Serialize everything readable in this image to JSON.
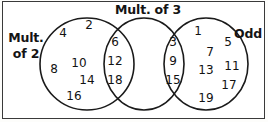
{
  "diagram": {
    "type": "venn",
    "set_count": 3,
    "stroke_color": "#1a1a1a",
    "fill_color": "#ffffff",
    "frame_color": "#3a3a3a",
    "sets": [
      {
        "id": "mult2",
        "label_line1": "Mult.",
        "label_line2": "of 2",
        "label_full": "Mult. of 2",
        "position": "left"
      },
      {
        "id": "mult3",
        "label_line1": "Mult. of 3",
        "label_line2": "",
        "label_full": "Mult. of 3",
        "position": "top-center"
      },
      {
        "id": "odd",
        "label_line1": "Odd",
        "label_line2": "",
        "label_full": "Odd",
        "position": "right"
      }
    ],
    "regions": {
      "mult2_only": {
        "name": "Mult. of 2 only",
        "values": [
          2,
          4,
          8,
          10,
          14,
          16
        ]
      },
      "mult2_and_mult3": {
        "name": "Mult. of 2 and Mult. of 3",
        "values": [
          6,
          12,
          18
        ]
      },
      "mult3_only": {
        "name": "Mult. of 3 only",
        "values": []
      },
      "mult3_and_odd": {
        "name": "Mult. of 3 and Odd",
        "values": [
          3,
          9,
          15
        ]
      },
      "odd_only": {
        "name": "Odd only",
        "values": [
          1,
          5,
          7,
          11,
          13,
          17,
          19
        ]
      }
    },
    "placed_numbers": [
      {
        "value": "4",
        "x": 63,
        "y": 33,
        "region": "mult2_only"
      },
      {
        "value": "2",
        "x": 89,
        "y": 25,
        "region": "mult2_only"
      },
      {
        "value": "8",
        "x": 54,
        "y": 69,
        "region": "mult2_only"
      },
      {
        "value": "10",
        "x": 79,
        "y": 63,
        "region": "mult2_only"
      },
      {
        "value": "14",
        "x": 87,
        "y": 80,
        "region": "mult2_only"
      },
      {
        "value": "16",
        "x": 74,
        "y": 96,
        "region": "mult2_only"
      },
      {
        "value": "6",
        "x": 115,
        "y": 42,
        "region": "mult2_and_mult3"
      },
      {
        "value": "12",
        "x": 115,
        "y": 61,
        "region": "mult2_and_mult3"
      },
      {
        "value": "18",
        "x": 115,
        "y": 80,
        "region": "mult2_and_mult3"
      },
      {
        "value": "3",
        "x": 173,
        "y": 42,
        "region": "mult3_and_odd"
      },
      {
        "value": "9",
        "x": 173,
        "y": 61,
        "region": "mult3_and_odd"
      },
      {
        "value": "15",
        "x": 173,
        "y": 80,
        "region": "mult3_and_odd"
      },
      {
        "value": "1",
        "x": 198,
        "y": 31,
        "region": "odd_only"
      },
      {
        "value": "5",
        "x": 228,
        "y": 42,
        "region": "odd_only"
      },
      {
        "value": "7",
        "x": 210,
        "y": 52,
        "region": "odd_only"
      },
      {
        "value": "13",
        "x": 206,
        "y": 70,
        "region": "odd_only"
      },
      {
        "value": "11",
        "x": 232,
        "y": 66,
        "region": "odd_only"
      },
      {
        "value": "17",
        "x": 229,
        "y": 85,
        "region": "odd_only"
      },
      {
        "value": "19",
        "x": 206,
        "y": 98,
        "region": "odd_only"
      }
    ],
    "circles": [
      {
        "id": "mult2",
        "cx": 87,
        "cy": 64,
        "rx": 47,
        "ry": 46
      },
      {
        "id": "mult3",
        "cx": 144,
        "cy": 64,
        "rx": 40,
        "ry": 46
      },
      {
        "id": "odd",
        "cx": 206,
        "cy": 64,
        "rx": 42,
        "ry": 46
      }
    ]
  }
}
